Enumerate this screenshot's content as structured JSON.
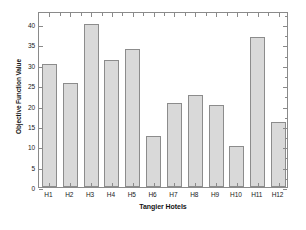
{
  "chart_data": {
    "type": "bar",
    "title": "",
    "subtitle": "",
    "xlabel": "Tangier Hotels",
    "ylabel": "Objective Function Value",
    "categories": [
      "H1",
      "H2",
      "H3",
      "H4",
      "H5",
      "H6",
      "H7",
      "H8",
      "H9",
      "H10",
      "H11",
      "H12"
    ],
    "values": [
      30.2,
      25.5,
      40.0,
      31.1,
      33.8,
      12.5,
      20.7,
      22.5,
      20.1,
      10.0,
      36.7,
      16.0
    ],
    "ylim": [
      0,
      43.2
    ],
    "yticks": [
      0,
      5,
      10,
      15,
      20,
      25,
      30,
      35,
      40
    ],
    "ytick_labels": [
      "0",
      "5",
      "10",
      "15",
      "20",
      "25",
      "30",
      "35",
      "40"
    ],
    "xtick_labels": [
      "H1",
      "H2",
      "H3",
      "H4",
      "H5",
      "H6",
      "H7",
      "H8",
      "H9",
      "H10",
      "H11",
      "H12"
    ],
    "grid": false,
    "legend": null,
    "legend_position": "none",
    "bar_color": "#d9d9d9",
    "bar_edge_color": "#8c8c8c",
    "axis_color": "#8a8a8a",
    "background_color": "#ffffff",
    "annotations": []
  }
}
